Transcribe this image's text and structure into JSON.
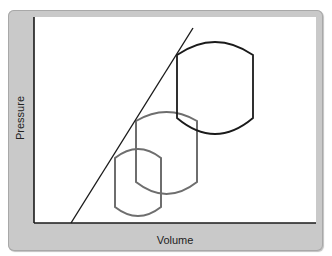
{
  "chart_data": {
    "type": "diagram",
    "title": "",
    "xlabel": "Volume",
    "ylabel": "Pressure",
    "axes": {
      "x_ticks": [],
      "y_ticks": [],
      "grid": false
    },
    "elements": [
      {
        "kind": "line",
        "name": "diagonal-boundary",
        "color": "#1a1a1a",
        "from": [
          71,
          223
        ],
        "to": [
          193,
          28
        ]
      },
      {
        "kind": "barrel-shape",
        "name": "large",
        "color": "#1a1a1a",
        "left": 177,
        "right": 253,
        "top_side_y": 55,
        "top_peak_y": 42,
        "bottom_side_y": 118,
        "bottom_peak_y": 134
      },
      {
        "kind": "barrel-shape",
        "name": "medium",
        "color": "#6e6e6e",
        "left": 136,
        "right": 197,
        "top_side_y": 121,
        "top_peak_y": 112,
        "bottom_side_y": 182,
        "bottom_peak_y": 194
      },
      {
        "kind": "barrel-shape",
        "name": "small",
        "color": "#6e6e6e",
        "left": 115,
        "right": 161,
        "top_side_y": 158,
        "top_peak_y": 149,
        "bottom_side_y": 207,
        "bottom_peak_y": 216
      }
    ]
  },
  "labels": {
    "x_axis": "Volume",
    "y_axis": "Pressure"
  },
  "colors": {
    "frame": "#c9c9c9",
    "plot_bg": "#ffffff",
    "dark_stroke": "#1a1a1a",
    "grey_stroke": "#6e6e6e"
  }
}
